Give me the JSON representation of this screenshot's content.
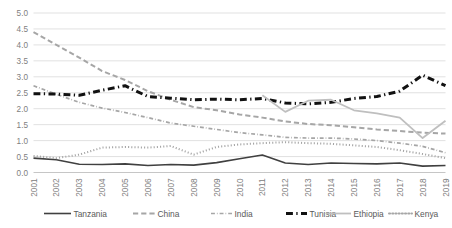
{
  "chart_data": {
    "type": "line",
    "title": "",
    "subtitle": "",
    "xlabel": "",
    "ylabel": "",
    "ylim": [
      0.0,
      5.0
    ],
    "ytick_step": 0.5,
    "grid": true,
    "legend_position": "bottom",
    "categories": [
      "2001",
      "2002",
      "2003",
      "2004",
      "2005",
      "2006",
      "2007",
      "2008",
      "2009",
      "2010",
      "2011",
      "2012",
      "2013",
      "2014",
      "2015",
      "2016",
      "2017",
      "2018",
      "2019"
    ],
    "ytick_labels": [
      "0.0",
      "0.5",
      "1.0",
      "1.5",
      "2.0",
      "2.5",
      "3.0",
      "3.5",
      "4.0",
      "4.5",
      "5.0"
    ],
    "series": [
      {
        "name": "Tanzania",
        "color": "#404040",
        "style": "solid",
        "width": 1.6,
        "values": [
          0.45,
          0.4,
          0.26,
          0.25,
          0.27,
          0.22,
          0.25,
          0.23,
          0.31,
          0.43,
          0.55,
          0.3,
          0.25,
          0.3,
          0.28,
          0.27,
          0.3,
          0.2,
          0.22
        ]
      },
      {
        "name": "China",
        "color": "#a6a6a6",
        "style": "dashed",
        "width": 2.0,
        "values": [
          4.4,
          4.0,
          3.6,
          3.18,
          2.9,
          2.55,
          2.28,
          2.05,
          1.95,
          1.82,
          1.72,
          1.6,
          1.52,
          1.48,
          1.42,
          1.35,
          1.3,
          1.25,
          1.22
        ]
      },
      {
        "name": "India",
        "color": "#a6a6a6",
        "style": "dashdot",
        "width": 1.7,
        "values": [
          2.72,
          2.45,
          2.2,
          2.02,
          1.88,
          1.72,
          1.55,
          1.45,
          1.35,
          1.25,
          1.18,
          1.1,
          1.08,
          1.08,
          1.05,
          1.0,
          0.92,
          0.82,
          0.62
        ]
      },
      {
        "name": "Tunisia",
        "color": "#111111",
        "style": "dashdot",
        "width": 3.0,
        "values": [
          2.47,
          2.46,
          2.42,
          2.58,
          2.72,
          2.38,
          2.33,
          2.28,
          2.3,
          2.28,
          2.32,
          2.18,
          2.15,
          2.2,
          2.32,
          2.38,
          2.55,
          3.05,
          2.72
        ]
      },
      {
        "name": "Ethiopia",
        "color": "#bfbfbf",
        "style": "solid",
        "width": 1.8,
        "values": [
          null,
          null,
          null,
          null,
          null,
          null,
          null,
          null,
          null,
          null,
          2.42,
          1.9,
          2.25,
          2.28,
          1.95,
          1.85,
          1.72,
          1.08,
          1.62
        ]
      },
      {
        "name": "Kenya",
        "color": "#a6a6a6",
        "style": "dotted",
        "width": 2.0,
        "values": [
          0.52,
          0.45,
          0.56,
          0.78,
          0.8,
          0.78,
          0.83,
          0.56,
          0.8,
          0.88,
          0.92,
          0.95,
          0.92,
          0.9,
          0.85,
          0.8,
          0.7,
          0.58,
          0.45
        ]
      }
    ]
  },
  "legend": {
    "items": [
      {
        "label": "Tanzania"
      },
      {
        "label": "China"
      },
      {
        "label": "India"
      },
      {
        "label": "Tunisia"
      },
      {
        "label": "Ethiopia"
      },
      {
        "label": "Kenya"
      }
    ]
  }
}
